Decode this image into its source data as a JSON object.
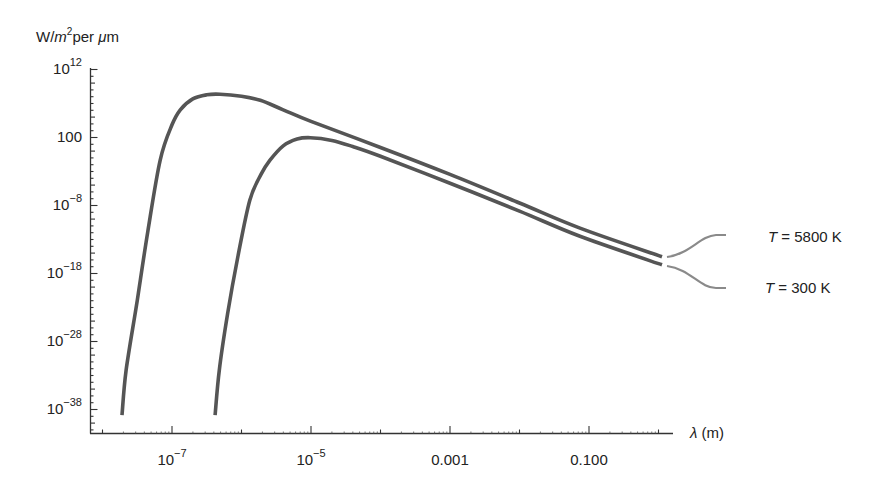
{
  "chart_data": {
    "type": "line",
    "title": "",
    "xlabel": "λ (m)",
    "ylabel": "W/m² per μm",
    "ylabel_parts": {
      "unit_w": "W/",
      "unit_m": "m",
      "sup": "2",
      "rest": "per ",
      "mu": "μ",
      "m2": "m"
    },
    "xlabel_parts": {
      "lambda": "λ",
      "rest": " (m)"
    },
    "x_scale": "log",
    "y_scale": "log",
    "xlim_log10": [
      -8.3,
      0.15
    ],
    "ylim_log10": [
      -41.5,
      12
    ],
    "x_ticks": [
      {
        "log10": -7,
        "base": "10",
        "exp": "−7",
        "label": "10^-7"
      },
      {
        "log10": -5,
        "base": "10",
        "exp": "−5",
        "label": "10^-5"
      },
      {
        "log10": -3,
        "text": "0.001",
        "label": "0.001"
      },
      {
        "log10": -1,
        "text": "0.100",
        "label": "0.100"
      }
    ],
    "x_minor_ticks_log10": [
      -8,
      -6,
      -4,
      -2,
      0
    ],
    "y_ticks": [
      {
        "log10": 12,
        "base": "10",
        "exp": "12",
        "label": "10^12"
      },
      {
        "log10": 2,
        "text": "100",
        "label": "100"
      },
      {
        "log10": -8,
        "base": "10",
        "exp": "−8",
        "label": "10^-8"
      },
      {
        "log10": -18,
        "base": "10",
        "exp": "−18",
        "label": "10^-18"
      },
      {
        "log10": -28,
        "base": "10",
        "exp": "−28",
        "label": "10^-28"
      },
      {
        "log10": -38,
        "base": "10",
        "exp": "−38",
        "label": "10^-38"
      }
    ],
    "grid": false,
    "legend_position": "right, inline labels with leader lines",
    "series": [
      {
        "name": "T = 5800 K",
        "label_t": "T",
        "label_rest": " = 5800 K",
        "color": "#555555",
        "points_log10": [
          [
            -7.72,
            -38.9
          ],
          [
            -7.66,
            -32.3
          ],
          [
            -7.5,
            -22.0
          ],
          [
            -7.35,
            -12.0
          ],
          [
            -7.17,
            -1.4
          ],
          [
            -7.0,
            3.8
          ],
          [
            -6.88,
            6.0
          ],
          [
            -6.7,
            7.6
          ],
          [
            -6.5,
            8.2
          ],
          [
            -6.31,
            8.3
          ],
          [
            -6.0,
            8.0
          ],
          [
            -5.73,
            7.4
          ],
          [
            -5.4,
            6.0
          ],
          [
            -5.0,
            4.3
          ],
          [
            -4.01,
            0.5
          ],
          [
            -3.0,
            -3.5
          ],
          [
            -2.0,
            -7.7
          ],
          [
            -1.13,
            -11.4
          ],
          [
            0.05,
            -15.6
          ]
        ]
      },
      {
        "name": "T = 300 K",
        "label_t": "T",
        "label_rest": " = 300 K",
        "color": "#555555",
        "points_log10": [
          [
            -6.38,
            -38.9
          ],
          [
            -6.32,
            -32.3
          ],
          [
            -6.2,
            -24.0
          ],
          [
            -6.05,
            -15.5
          ],
          [
            -5.88,
            -7.3
          ],
          [
            -5.72,
            -3.5
          ],
          [
            -5.59,
            -1.4
          ],
          [
            -5.4,
            0.7
          ],
          [
            -5.2,
            1.7
          ],
          [
            -5.01,
            1.9
          ],
          [
            -4.7,
            1.5
          ],
          [
            -4.4,
            0.6
          ],
          [
            -4.01,
            -0.8
          ],
          [
            -3.0,
            -4.8
          ],
          [
            -2.0,
            -8.9
          ],
          [
            -1.13,
            -12.6
          ],
          [
            0.05,
            -16.8
          ]
        ]
      }
    ],
    "annotations": [
      {
        "text": "T = 5800 K",
        "target_series": 0
      },
      {
        "text": "T = 300 K",
        "target_series": 1
      }
    ]
  }
}
